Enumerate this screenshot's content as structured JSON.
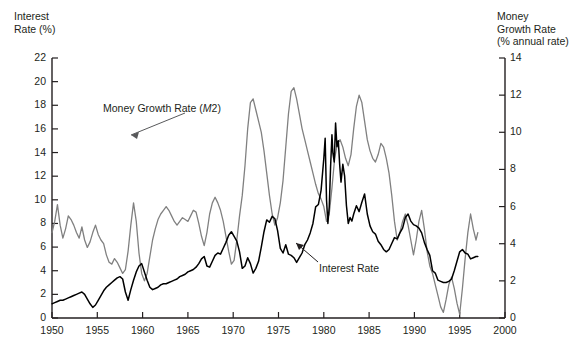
{
  "chart_data": {
    "type": "line",
    "title": "",
    "xlabel": "",
    "ylabel": "Interest Rate (%)",
    "y2label": "Money Growth Rate (% annual rate)",
    "grid": false,
    "legend_position": "inline-annotations",
    "xlim": [
      1950,
      2000
    ],
    "ylim": [
      0,
      22
    ],
    "y2lim": [
      0,
      14
    ],
    "xticks": [
      1950,
      1955,
      1960,
      1965,
      1970,
      1975,
      1980,
      1985,
      1990,
      1995,
      2000
    ],
    "yticks_left": [
      0,
      2,
      4,
      6,
      8,
      10,
      12,
      14,
      16,
      18,
      20,
      22
    ],
    "yticks_right": [
      0,
      2,
      4,
      6,
      8,
      10,
      12,
      14
    ],
    "series": [
      {
        "name": "Money Growth Rate (M2)",
        "axis": "right",
        "color": "#808080",
        "x": [
          1950.0,
          1950.3,
          1950.6,
          1950.9,
          1951.2,
          1951.5,
          1951.8,
          1952.1,
          1952.4,
          1952.7,
          1953.0,
          1953.3,
          1953.6,
          1953.9,
          1954.2,
          1954.5,
          1954.8,
          1955.1,
          1955.4,
          1955.7,
          1956.0,
          1956.3,
          1956.6,
          1956.9,
          1957.2,
          1957.5,
          1957.8,
          1958.1,
          1958.4,
          1958.7,
          1959.0,
          1959.3,
          1959.6,
          1959.9,
          1960.2,
          1960.5,
          1960.8,
          1961.1,
          1961.4,
          1961.7,
          1962.0,
          1962.3,
          1962.6,
          1962.9,
          1963.2,
          1963.5,
          1963.8,
          1964.1,
          1964.4,
          1964.7,
          1965.0,
          1965.3,
          1965.6,
          1965.9,
          1966.2,
          1966.5,
          1966.8,
          1967.1,
          1967.4,
          1967.7,
          1968.0,
          1968.3,
          1968.6,
          1968.9,
          1969.2,
          1969.5,
          1969.8,
          1970.1,
          1970.4,
          1970.7,
          1971.0,
          1971.3,
          1971.6,
          1971.9,
          1972.2,
          1972.5,
          1972.8,
          1973.1,
          1973.4,
          1973.7,
          1974.0,
          1974.3,
          1974.6,
          1974.9,
          1975.2,
          1975.5,
          1975.8,
          1976.1,
          1976.4,
          1976.7,
          1977.0,
          1977.3,
          1977.6,
          1977.9,
          1978.2,
          1978.5,
          1978.8,
          1979.1,
          1979.4,
          1979.7,
          1980.0,
          1980.3,
          1980.6,
          1980.9,
          1981.2,
          1981.5,
          1981.8,
          1982.1,
          1982.4,
          1982.7,
          1983.0,
          1983.3,
          1983.6,
          1983.9,
          1984.2,
          1984.5,
          1984.8,
          1985.1,
          1985.4,
          1985.7,
          1986.0,
          1986.3,
          1986.6,
          1986.9,
          1987.2,
          1987.5,
          1987.8,
          1988.1,
          1988.4,
          1988.7,
          1989.0,
          1989.3,
          1989.6,
          1989.9,
          1990.2,
          1990.5,
          1990.8,
          1991.1,
          1991.4,
          1991.7,
          1992.0,
          1992.3,
          1992.6,
          1992.9,
          1993.2,
          1993.5,
          1993.8,
          1994.1,
          1994.4,
          1994.7,
          1995.0,
          1995.3,
          1995.6,
          1995.9,
          1996.2,
          1996.5,
          1996.8,
          1997.0
        ],
        "values": [
          4.6,
          5.2,
          6.1,
          5.0,
          4.3,
          4.8,
          5.5,
          5.3,
          5.0,
          4.6,
          4.3,
          4.9,
          4.2,
          3.8,
          4.1,
          4.6,
          5.0,
          4.5,
          4.2,
          4.0,
          3.4,
          3.0,
          2.9,
          3.2,
          3.0,
          2.7,
          2.4,
          2.6,
          3.6,
          5.0,
          6.2,
          5.2,
          3.5,
          2.4,
          2.0,
          2.4,
          3.3,
          4.2,
          4.8,
          5.3,
          5.6,
          5.8,
          6.0,
          5.8,
          5.5,
          5.2,
          5.0,
          5.2,
          5.4,
          5.3,
          5.2,
          5.5,
          5.8,
          5.7,
          5.1,
          4.4,
          3.9,
          4.6,
          5.6,
          6.2,
          6.5,
          6.2,
          5.8,
          5.2,
          4.4,
          3.6,
          2.9,
          3.1,
          4.2,
          5.5,
          6.6,
          8.2,
          10.2,
          11.6,
          11.8,
          11.2,
          10.6,
          10.0,
          9.0,
          7.8,
          6.6,
          5.6,
          5.0,
          5.4,
          6.2,
          7.4,
          9.2,
          11.0,
          12.2,
          12.4,
          11.8,
          11.0,
          10.2,
          9.6,
          9.0,
          8.4,
          7.8,
          7.2,
          6.7,
          6.4,
          6.0,
          5.2,
          5.6,
          7.0,
          8.6,
          9.4,
          9.6,
          9.2,
          8.6,
          8.2,
          8.8,
          10.2,
          11.4,
          12.0,
          11.6,
          10.6,
          9.6,
          9.0,
          8.6,
          8.4,
          8.8,
          9.4,
          9.2,
          8.6,
          7.8,
          6.6,
          5.2,
          4.2,
          4.6,
          5.2,
          5.6,
          5.0,
          4.2,
          3.4,
          4.2,
          5.2,
          5.8,
          4.8,
          3.6,
          2.8,
          2.4,
          1.8,
          1.2,
          0.6,
          0.3,
          1.0,
          1.8,
          2.2,
          1.6,
          0.8,
          0.2,
          1.6,
          3.2,
          4.6,
          5.6,
          4.8,
          4.2,
          4.6
        ]
      },
      {
        "name": "Interest Rate",
        "axis": "left",
        "color": "#000000",
        "x": [
          1950.0,
          1950.3,
          1950.6,
          1950.9,
          1951.2,
          1951.5,
          1951.8,
          1952.1,
          1952.4,
          1952.7,
          1953.0,
          1953.3,
          1953.6,
          1953.9,
          1954.2,
          1954.5,
          1954.8,
          1955.1,
          1955.4,
          1955.7,
          1956.0,
          1956.3,
          1956.6,
          1956.9,
          1957.2,
          1957.5,
          1957.8,
          1958.1,
          1958.4,
          1958.7,
          1959.0,
          1959.3,
          1959.6,
          1959.9,
          1960.2,
          1960.5,
          1960.8,
          1961.1,
          1961.4,
          1961.7,
          1962.0,
          1962.3,
          1962.6,
          1962.9,
          1963.2,
          1963.5,
          1963.8,
          1964.1,
          1964.4,
          1964.7,
          1965.0,
          1965.3,
          1965.6,
          1965.9,
          1966.2,
          1966.5,
          1966.8,
          1967.1,
          1967.4,
          1967.7,
          1968.0,
          1968.3,
          1968.6,
          1968.9,
          1969.2,
          1969.5,
          1969.8,
          1970.1,
          1970.4,
          1970.7,
          1971.0,
          1971.3,
          1971.6,
          1971.9,
          1972.2,
          1972.5,
          1972.8,
          1973.1,
          1973.4,
          1973.7,
          1974.0,
          1974.3,
          1974.6,
          1974.9,
          1975.2,
          1975.5,
          1975.8,
          1976.1,
          1976.4,
          1976.7,
          1977.0,
          1977.3,
          1977.6,
          1977.9,
          1978.2,
          1978.5,
          1978.8,
          1979.1,
          1979.4,
          1979.7,
          1980.0,
          1980.15,
          1980.3,
          1980.45,
          1980.6,
          1980.75,
          1980.9,
          1981.0,
          1981.15,
          1981.3,
          1981.45,
          1981.6,
          1981.75,
          1981.9,
          1982.1,
          1982.3,
          1982.5,
          1982.7,
          1982.9,
          1983.1,
          1983.3,
          1983.6,
          1983.9,
          1984.2,
          1984.5,
          1984.8,
          1985.1,
          1985.4,
          1985.7,
          1986.0,
          1986.3,
          1986.6,
          1986.9,
          1987.2,
          1987.5,
          1987.8,
          1988.1,
          1988.4,
          1988.7,
          1989.0,
          1989.3,
          1989.6,
          1989.9,
          1990.2,
          1990.5,
          1990.8,
          1991.1,
          1991.4,
          1991.7,
          1992.0,
          1992.3,
          1992.6,
          1992.9,
          1993.2,
          1993.5,
          1993.8,
          1994.1,
          1994.4,
          1994.7,
          1995.0,
          1995.3,
          1995.6,
          1995.9,
          1996.2,
          1996.5,
          1996.8,
          1997.0
        ],
        "values": [
          1.2,
          1.3,
          1.4,
          1.5,
          1.5,
          1.6,
          1.7,
          1.8,
          1.9,
          2.0,
          2.1,
          2.2,
          2.0,
          1.6,
          1.2,
          0.9,
          1.1,
          1.5,
          1.9,
          2.3,
          2.6,
          2.8,
          3.0,
          3.2,
          3.4,
          3.5,
          3.3,
          2.2,
          1.5,
          2.4,
          3.2,
          3.9,
          4.4,
          4.6,
          3.9,
          3.2,
          2.6,
          2.4,
          2.5,
          2.6,
          2.8,
          2.9,
          2.9,
          3.0,
          3.1,
          3.2,
          3.3,
          3.5,
          3.6,
          3.7,
          3.9,
          4.0,
          4.1,
          4.3,
          4.6,
          5.0,
          5.2,
          4.4,
          4.3,
          4.8,
          5.3,
          5.5,
          5.4,
          5.9,
          6.4,
          7.0,
          7.3,
          6.9,
          6.5,
          5.6,
          4.2,
          4.4,
          5.1,
          4.6,
          3.8,
          4.2,
          4.8,
          6.0,
          7.3,
          8.3,
          8.1,
          8.6,
          8.4,
          7.4,
          5.9,
          5.5,
          6.2,
          5.4,
          5.3,
          5.1,
          4.7,
          5.1,
          5.5,
          6.2,
          6.6,
          7.2,
          8.0,
          9.4,
          9.6,
          10.8,
          13.5,
          15.2,
          10.0,
          8.0,
          9.4,
          12.8,
          15.5,
          14.0,
          13.2,
          16.5,
          14.5,
          15.0,
          13.0,
          11.5,
          13.0,
          12.0,
          9.5,
          8.0,
          8.5,
          8.2,
          8.8,
          9.5,
          9.0,
          9.8,
          10.5,
          8.8,
          7.8,
          7.3,
          7.1,
          6.5,
          6.2,
          5.8,
          5.6,
          5.8,
          6.3,
          6.8,
          6.7,
          7.2,
          7.6,
          8.5,
          8.8,
          8.2,
          7.9,
          7.8,
          7.6,
          7.2,
          6.4,
          5.8,
          5.3,
          4.0,
          3.8,
          3.2,
          3.1,
          3.0,
          3.0,
          3.1,
          3.3,
          4.0,
          4.8,
          5.6,
          5.8,
          5.5,
          5.4,
          5.0,
          5.1,
          5.2,
          5.2
        ]
      }
    ],
    "annotations": [
      {
        "name": "money-growth-annotation",
        "text_before": "Money Growth Rate (",
        "italic": "M",
        "text_after": "2)",
        "full_text": "Money Growth Rate (M2)"
      },
      {
        "name": "interest-rate-annotation",
        "full_text": "Interest Rate"
      }
    ]
  },
  "axes": {
    "left_title_line1": "Interest",
    "left_title_line2": "Rate (%)",
    "right_title_line1": "Money",
    "right_title_line2": "Growth Rate",
    "right_title_line3": "(% annual rate)"
  },
  "colors": {
    "money_growth_line": "#808080",
    "interest_rate_line": "#000000",
    "axis": "#231f20",
    "text": "#231f20",
    "background": "#ffffff"
  }
}
